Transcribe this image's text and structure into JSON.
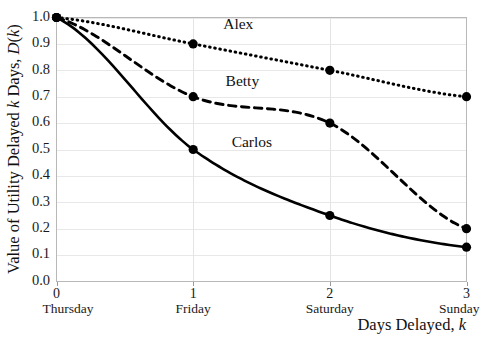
{
  "chart_data": {
    "type": "line",
    "title": "",
    "xlabel": "Days Delayed, k",
    "ylabel": "Value of Utility Delayed k Days, D(k)",
    "x": [
      0,
      1,
      2,
      3
    ],
    "xlim": [
      0,
      3
    ],
    "ylim": [
      0.0,
      1.0
    ],
    "grid": true,
    "legend_position": "inline-labels",
    "xtick_labels": [
      "0",
      "1",
      "2",
      "3"
    ],
    "xtick_sublabels": [
      "Thursday",
      "Friday",
      "Saturday",
      "Sunday"
    ],
    "ytick_labels": [
      "0.0",
      "0.1",
      "0.2",
      "0.3",
      "0.4",
      "0.5",
      "0.6",
      "0.7",
      "0.8",
      "0.9",
      "1.0"
    ],
    "ytick_values": [
      0.0,
      0.1,
      0.2,
      0.3,
      0.4,
      0.5,
      0.6,
      0.7,
      0.8,
      0.9,
      1.0
    ],
    "series": [
      {
        "name": "Alex",
        "style": "dotted",
        "values": [
          1.0,
          0.9,
          0.8,
          0.7
        ],
        "label_x": 1.33,
        "label_y": 0.955
      },
      {
        "name": "Betty",
        "style": "dashed",
        "values": [
          1.0,
          0.7,
          0.6,
          0.2
        ],
        "label_x": 1.36,
        "label_y": 0.742
      },
      {
        "name": "Carlos",
        "style": "solid",
        "values": [
          1.0,
          0.5,
          0.25,
          0.13
        ],
        "label_x": 1.43,
        "label_y": 0.508
      }
    ]
  },
  "axis_titles": {
    "x_main": "Days Delayed,",
    "x_italic": "k",
    "y_part1": "Value of Utility Delayed",
    "y_italic1": "k",
    "y_part2": "Days,",
    "y_italic2": "D",
    "y_part3": "(",
    "y_italic3": "k",
    "y_part4": ")"
  },
  "colors": {
    "series": "#000000",
    "gridline": "#e8e8e8",
    "frame": "#b8b8b8",
    "background": "#ffffff",
    "text": "#111111"
  }
}
